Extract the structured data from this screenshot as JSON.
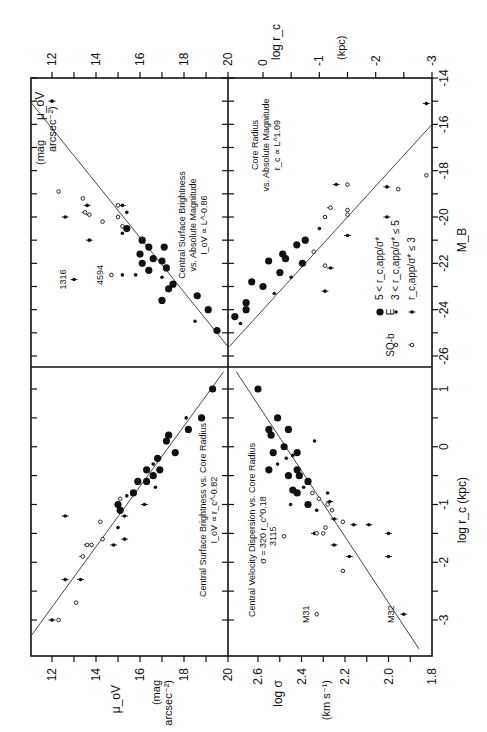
{
  "figure": {
    "orientation": "rotated 90 degrees clockwise",
    "legend": {
      "header_s0b": "SO-b",
      "header_e": "E",
      "entries": [
        {
          "label": "5 < r_c,app/σ*",
          "marker_e": "large-filled-circle",
          "marker_s0b": ""
        },
        {
          "label": "3 < r_c,app/σ* ≤ 5",
          "marker_e": "small-filled-dot",
          "marker_s0b": "open-circle"
        },
        {
          "label": "r_c,app/σ* ≤ 3",
          "marker_e": "filled-dot-with-tick",
          "marker_s0b": "open-circle-with-tick"
        }
      ]
    },
    "axes": {
      "top_left": {
        "label": "μ_oV",
        "units": "(mag arcsec⁻²)",
        "ticks": [
          "12",
          "14",
          "16",
          "18",
          "20"
        ]
      },
      "top_right": {
        "label": "log r_c",
        "units": "(kpc)",
        "ticks": [
          "0",
          "-1",
          "-2",
          "-3"
        ]
      },
      "bottom_left": {
        "label": "μ_oV",
        "units": "(mag arcsec⁻²)",
        "ticks": [
          "12",
          "14",
          "16",
          "18",
          "20"
        ]
      },
      "bottom_right": {
        "label": "log σ",
        "units": "(km s⁻¹)",
        "ticks": [
          "2.6",
          "2.4",
          "2.2",
          "2.0",
          "1.8"
        ]
      },
      "right_top": {
        "label": "M_B",
        "ticks": [
          "-14",
          "-16",
          "-18",
          "-20",
          "-22",
          "-24",
          "-26"
        ]
      },
      "right_bottom": {
        "label": "log r_c (kpc)",
        "ticks": [
          "1",
          "0",
          "-1",
          "-2",
          "-3"
        ]
      }
    }
  },
  "chart_data": [
    {
      "type": "scatter",
      "panel": "upper-left",
      "title": "Central Surface Brightness vs. Absolute Magnitude",
      "relation": "I_oV ∝ L^-0.86",
      "xlabel": "M_B",
      "ylabel": "μ_oV (mag arcsec^-2)",
      "xlim": [
        -26,
        -14
      ],
      "ylim": [
        20,
        11
      ],
      "annotations": [
        "1316",
        "4594"
      ],
      "fit_line": [
        [
          -25.6,
          20.0
        ],
        [
          -15.0,
          11.0
        ]
      ],
      "points": [
        {
          "x": -15.0,
          "y": 12.0,
          "m": "tick"
        },
        {
          "x": -18.9,
          "y": 12.3,
          "m": "open"
        },
        {
          "x": -19.2,
          "y": 13.4,
          "m": "open"
        },
        {
          "x": -19.5,
          "y": 13.6,
          "m": "tick"
        },
        {
          "x": -19.9,
          "y": 13.7,
          "m": "open-tick"
        },
        {
          "x": -19.8,
          "y": 13.5,
          "m": "open-tick"
        },
        {
          "x": -20.0,
          "y": 12.6,
          "m": "tick"
        },
        {
          "x": -21.0,
          "y": 13.7,
          "m": "tick"
        },
        {
          "x": -19.5,
          "y": 15.2,
          "m": "tick"
        },
        {
          "x": -19.5,
          "y": 15.0,
          "m": "open"
        },
        {
          "x": -19.8,
          "y": 15.4,
          "m": "dot"
        },
        {
          "x": -20.0,
          "y": 15.0,
          "m": "open"
        },
        {
          "x": -20.2,
          "y": 14.3,
          "m": "open"
        },
        {
          "x": -20.4,
          "y": 15.2,
          "m": "open"
        },
        {
          "x": -20.5,
          "y": 15.4,
          "m": "big"
        },
        {
          "x": -20.7,
          "y": 15.2,
          "m": "dot"
        },
        {
          "x": -21.0,
          "y": 16.1,
          "m": "big"
        },
        {
          "x": -21.3,
          "y": 16.4,
          "m": "big"
        },
        {
          "x": -21.3,
          "y": 17.1,
          "m": "big"
        },
        {
          "x": -21.6,
          "y": 16.0,
          "m": "big"
        },
        {
          "x": -21.8,
          "y": 16.6,
          "m": "big"
        },
        {
          "x": -22.0,
          "y": 16.1,
          "m": "big"
        },
        {
          "x": -22.2,
          "y": 17.2,
          "m": "big"
        },
        {
          "x": -22.3,
          "y": 16.4,
          "m": "big"
        },
        {
          "x": -21.9,
          "y": 17.0,
          "m": "big"
        },
        {
          "x": -22.5,
          "y": 15.8,
          "m": "dot"
        },
        {
          "x": -22.5,
          "y": 15.2,
          "m": "dot"
        },
        {
          "x": -22.6,
          "y": 17.0,
          "m": "dot"
        },
        {
          "x": -22.9,
          "y": 17.5,
          "m": "big"
        },
        {
          "x": -23.1,
          "y": 17.3,
          "m": "big"
        },
        {
          "x": -23.6,
          "y": 17.0,
          "m": "big"
        },
        {
          "x": -23.4,
          "y": 18.6,
          "m": "big"
        },
        {
          "x": -24.0,
          "y": 19.1,
          "m": "big"
        },
        {
          "x": -24.9,
          "y": 19.5,
          "m": "big"
        },
        {
          "x": -24.5,
          "y": 18.5,
          "m": "dot"
        },
        {
          "x": -22.5,
          "y": 14.7,
          "m": "open",
          "label": "4594"
        },
        {
          "x": -22.7,
          "y": 13.0,
          "m": "tick",
          "label": "1316"
        }
      ]
    },
    {
      "type": "scatter",
      "panel": "upper-right",
      "title": "Core Radius vs. Absolute Magnitude",
      "relation": "r_c ∝ L^1.09",
      "xlabel": "M_B",
      "ylabel": "log r_c (kpc)",
      "xlim": [
        -26,
        -14
      ],
      "ylim": [
        0.6,
        -3
      ],
      "fit_line": [
        [
          -25.6,
          0.6
        ],
        [
          -16.0,
          -3.0
        ]
      ],
      "points": [
        {
          "x": -15.1,
          "y": -2.9,
          "m": "tick"
        },
        {
          "x": -18.6,
          "y": -1.3,
          "m": "tick"
        },
        {
          "x": -18.6,
          "y": -1.5,
          "m": "open"
        },
        {
          "x": -18.7,
          "y": -2.2,
          "m": "tick"
        },
        {
          "x": -18.8,
          "y": -2.4,
          "m": "open"
        },
        {
          "x": -18.2,
          "y": -2.9,
          "m": "open"
        },
        {
          "x": -19.6,
          "y": -1.2,
          "m": "open-tick"
        },
        {
          "x": -19.7,
          "y": -1.5,
          "m": "open"
        },
        {
          "x": -19.9,
          "y": -1.5,
          "m": "open"
        },
        {
          "x": -20.0,
          "y": -1.1,
          "m": "open"
        },
        {
          "x": -20.0,
          "y": -2.2,
          "m": "tick"
        },
        {
          "x": -20.5,
          "y": -1.0,
          "m": "dot"
        },
        {
          "x": -20.8,
          "y": -1.5,
          "m": "tick"
        },
        {
          "x": -21.0,
          "y": -0.75,
          "m": "big"
        },
        {
          "x": -21.2,
          "y": -0.6,
          "m": "big"
        },
        {
          "x": -21.5,
          "y": -0.9,
          "m": "open"
        },
        {
          "x": -21.6,
          "y": -0.35,
          "m": "big"
        },
        {
          "x": -21.8,
          "y": -0.4,
          "m": "big"
        },
        {
          "x": -21.9,
          "y": -0.1,
          "m": "big"
        },
        {
          "x": -22.0,
          "y": -0.7,
          "m": "big"
        },
        {
          "x": -22.1,
          "y": -1.1,
          "m": "open"
        },
        {
          "x": -22.2,
          "y": -1.2,
          "m": "tick"
        },
        {
          "x": -22.4,
          "y": -0.3,
          "m": "big"
        },
        {
          "x": -22.6,
          "y": -0.5,
          "m": "dot"
        },
        {
          "x": -22.8,
          "y": 0.2,
          "m": "big"
        },
        {
          "x": -23.0,
          "y": 0.0,
          "m": "big"
        },
        {
          "x": -23.3,
          "y": -0.2,
          "m": "dot"
        },
        {
          "x": -23.2,
          "y": -1.1,
          "m": "tick"
        },
        {
          "x": -23.7,
          "y": 0.3,
          "m": "big"
        },
        {
          "x": -24.0,
          "y": 0.3,
          "m": "big"
        },
        {
          "x": -24.3,
          "y": 0.5,
          "m": "big"
        },
        {
          "x": -24.6,
          "y": 0.4,
          "m": "dot"
        }
      ]
    },
    {
      "type": "scatter",
      "panel": "lower-left",
      "title": "Central Surface Brightness vs. Core Radius",
      "relation": "I_oV ∝ r_c^-0.82",
      "xlabel": "log r_c (kpc)",
      "ylabel": "μ_oV (mag arcsec^-2)",
      "xlim": [
        1.3,
        -3.6
      ],
      "ylim": [
        20,
        11
      ],
      "fit_line": [
        [
          1.3,
          19.8
        ],
        [
          -3.3,
          11.0
        ]
      ],
      "points": [
        {
          "x": 1.0,
          "y": 19.3,
          "m": "big"
        },
        {
          "x": 0.5,
          "y": 18.8,
          "m": "big"
        },
        {
          "x": 0.3,
          "y": 18.2,
          "m": "big"
        },
        {
          "x": 0.5,
          "y": 18.1,
          "m": "dot"
        },
        {
          "x": 0.2,
          "y": 17.3,
          "m": "big"
        },
        {
          "x": 0.1,
          "y": 17.2,
          "m": "big"
        },
        {
          "x": -0.1,
          "y": 17.6,
          "m": "big"
        },
        {
          "x": -0.2,
          "y": 16.8,
          "m": "big"
        },
        {
          "x": -0.3,
          "y": 16.6,
          "m": "dot"
        },
        {
          "x": -0.4,
          "y": 16.9,
          "m": "big"
        },
        {
          "x": -0.4,
          "y": 16.3,
          "m": "big"
        },
        {
          "x": -0.5,
          "y": 16.6,
          "m": "big"
        },
        {
          "x": -0.6,
          "y": 15.9,
          "m": "big"
        },
        {
          "x": -0.6,
          "y": 16.3,
          "m": "big"
        },
        {
          "x": -0.7,
          "y": 16.7,
          "m": "dot"
        },
        {
          "x": -0.8,
          "y": 15.7,
          "m": "big"
        },
        {
          "x": -0.85,
          "y": 15.4,
          "m": "dot"
        },
        {
          "x": -0.9,
          "y": 15.1,
          "m": "open"
        },
        {
          "x": -1.0,
          "y": 15.0,
          "m": "big"
        },
        {
          "x": -1.0,
          "y": 16.2,
          "m": "tick"
        },
        {
          "x": -1.1,
          "y": 15.1,
          "m": "big"
        },
        {
          "x": -1.2,
          "y": 15.3,
          "m": "tick"
        },
        {
          "x": -1.4,
          "y": 15.0,
          "m": "dot"
        },
        {
          "x": -1.3,
          "y": 14.2,
          "m": "open"
        },
        {
          "x": -1.6,
          "y": 14.3,
          "m": "open"
        },
        {
          "x": -1.6,
          "y": 15.3,
          "m": "tick"
        },
        {
          "x": -1.7,
          "y": 14.8,
          "m": "tick"
        },
        {
          "x": -1.2,
          "y": 12.6,
          "m": "tick"
        },
        {
          "x": -1.9,
          "y": 13.4,
          "m": "open-tick"
        },
        {
          "x": -1.7,
          "y": 13.6,
          "m": "open-tick"
        },
        {
          "x": -1.7,
          "y": 13.8,
          "m": "open"
        },
        {
          "x": -2.3,
          "y": 12.6,
          "m": "tick"
        },
        {
          "x": -2.3,
          "y": 13.3,
          "m": "tick"
        },
        {
          "x": -2.7,
          "y": 13.1,
          "m": "open"
        },
        {
          "x": -3.0,
          "y": 12.0,
          "m": "tick"
        },
        {
          "x": -3.0,
          "y": 12.3,
          "m": "open"
        }
      ]
    },
    {
      "type": "scatter",
      "panel": "lower-right",
      "title": "Central Velocity Dispersion vs. Core Radius",
      "relation": "σ = 320 r_c^0.18",
      "xlabel": "log r_c (kpc)",
      "ylabel": "log σ (km s^-1)",
      "xlim": [
        1.3,
        -3.6
      ],
      "ylim": [
        2.7,
        1.8
      ],
      "annotations": [
        "3115",
        "M31",
        "M32"
      ],
      "fit_line": [
        [
          1.3,
          2.7
        ],
        [
          -3.5,
          1.86
        ]
      ],
      "points": [
        {
          "x": 1.0,
          "y": 2.6,
          "m": "big"
        },
        {
          "x": 0.5,
          "y": 2.51,
          "m": "big"
        },
        {
          "x": 0.3,
          "y": 2.55,
          "m": "big"
        },
        {
          "x": 0.2,
          "y": 2.54,
          "m": "big"
        },
        {
          "x": 0.3,
          "y": 2.46,
          "m": "big"
        },
        {
          "x": 0.1,
          "y": 2.34,
          "m": "dot"
        },
        {
          "x": 0.0,
          "y": 2.48,
          "m": "big"
        },
        {
          "x": -0.1,
          "y": 2.53,
          "m": "big"
        },
        {
          "x": -0.1,
          "y": 2.42,
          "m": "big"
        },
        {
          "x": -0.15,
          "y": 2.44,
          "m": "dot"
        },
        {
          "x": -0.2,
          "y": 2.47,
          "m": "dot"
        },
        {
          "x": -0.3,
          "y": 2.51,
          "m": "dot"
        },
        {
          "x": -0.4,
          "y": 2.55,
          "m": "big"
        },
        {
          "x": -0.4,
          "y": 2.42,
          "m": "big"
        },
        {
          "x": -0.5,
          "y": 2.46,
          "m": "big"
        },
        {
          "x": -0.5,
          "y": 2.41,
          "m": "big"
        },
        {
          "x": -0.6,
          "y": 2.37,
          "m": "big"
        },
        {
          "x": -0.7,
          "y": 2.39,
          "m": "dot"
        },
        {
          "x": -0.75,
          "y": 2.44,
          "m": "big"
        },
        {
          "x": -0.8,
          "y": 2.42,
          "m": "big"
        },
        {
          "x": -0.8,
          "y": 2.35,
          "m": "open"
        },
        {
          "x": -0.9,
          "y": 2.32,
          "m": "open"
        },
        {
          "x": -0.8,
          "y": 2.28,
          "m": "dot"
        },
        {
          "x": -1.0,
          "y": 2.37,
          "m": "big"
        },
        {
          "x": -1.0,
          "y": 2.45,
          "m": "dot"
        },
        {
          "x": -0.95,
          "y": 2.27,
          "m": "tick"
        },
        {
          "x": -1.0,
          "y": 2.28,
          "m": "open"
        },
        {
          "x": -1.1,
          "y": 2.33,
          "m": "dot"
        },
        {
          "x": -1.1,
          "y": 2.26,
          "m": "open"
        },
        {
          "x": -1.25,
          "y": 2.25,
          "m": "tick"
        },
        {
          "x": -1.3,
          "y": 2.21,
          "m": "open"
        },
        {
          "x": -1.35,
          "y": 2.16,
          "m": "tick"
        },
        {
          "x": -1.35,
          "y": 2.09,
          "m": "tick"
        },
        {
          "x": -1.5,
          "y": 2.34,
          "m": "tick"
        },
        {
          "x": -1.5,
          "y": 2.33,
          "m": "open"
        },
        {
          "x": -1.5,
          "y": 2.3,
          "m": "open"
        },
        {
          "x": -1.4,
          "y": 2.29,
          "m": "open"
        },
        {
          "x": -1.5,
          "y": 2.0,
          "m": "tick"
        },
        {
          "x": -1.7,
          "y": 2.25,
          "m": "tick"
        },
        {
          "x": -1.9,
          "y": 2.18,
          "m": "tick"
        },
        {
          "x": -1.9,
          "y": 2.0,
          "m": "tick"
        },
        {
          "x": -2.15,
          "y": 2.21,
          "m": "open"
        },
        {
          "x": -1.55,
          "y": 2.48,
          "m": "open",
          "label": "3115"
        },
        {
          "x": -2.9,
          "y": 2.33,
          "m": "open",
          "label": "M31"
        },
        {
          "x": -2.9,
          "y": 1.93,
          "m": "tick",
          "label": "M32"
        }
      ]
    }
  ]
}
